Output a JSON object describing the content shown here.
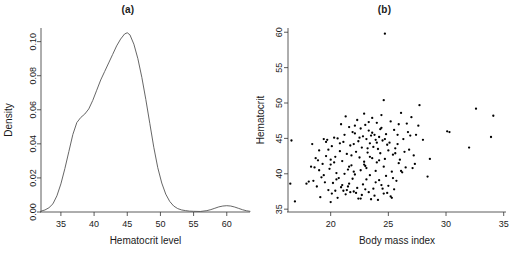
{
  "figure": {
    "panels": [
      {
        "id": "a",
        "title": "(a)"
      },
      {
        "id": "b",
        "title": "(b)"
      }
    ]
  },
  "chart_data": [
    {
      "type": "line",
      "panel": "(a)",
      "title": "(a)",
      "xlabel": "Hematocrit level",
      "ylabel": "Density",
      "xlim": [
        32.0,
        63.5
      ],
      "ylim": [
        0.0,
        0.108
      ],
      "xticks": [
        35,
        40,
        45,
        50,
        55,
        60
      ],
      "yticks": [
        0.0,
        0.02,
        0.04,
        0.06,
        0.08,
        0.1
      ],
      "ytick_labels": [
        "0.00",
        "0.02",
        "0.04",
        "0.06",
        "0.08",
        "0.10"
      ],
      "xtick_labels": [
        "35",
        "40",
        "45",
        "50",
        "55",
        "60"
      ],
      "grid": false,
      "legend": "none",
      "series": [
        {
          "name": "Hematocrit level kernel density",
          "x": [
            32.0,
            32.6,
            33.2,
            33.8,
            34.4,
            35.0,
            35.6,
            36.2,
            36.8,
            37.4,
            38.0,
            38.6,
            39.2,
            39.8,
            40.4,
            41.0,
            41.6,
            42.2,
            42.8,
            43.4,
            44.0,
            44.6,
            45.0,
            45.4,
            46.0,
            46.6,
            47.2,
            47.8,
            48.4,
            49.0,
            49.6,
            50.2,
            50.8,
            51.4,
            52.0,
            52.6,
            53.2,
            53.8,
            54.4,
            55.0,
            56.0,
            57.0,
            57.6,
            58.2,
            58.8,
            59.4,
            60.0,
            60.6,
            61.2,
            61.8,
            62.4,
            63.0,
            63.5
          ],
          "y": [
            0.0005,
            0.0012,
            0.0025,
            0.0048,
            0.0095,
            0.0165,
            0.0255,
            0.0355,
            0.0455,
            0.0525,
            0.0555,
            0.0575,
            0.0605,
            0.0655,
            0.0715,
            0.0775,
            0.0825,
            0.0875,
            0.0925,
            0.0975,
            0.1015,
            0.1045,
            0.1052,
            0.104,
            0.0985,
            0.09,
            0.079,
            0.066,
            0.052,
            0.038,
            0.026,
            0.017,
            0.0105,
            0.0062,
            0.0035,
            0.002,
            0.0012,
            0.0008,
            0.0005,
            0.0004,
            0.0003,
            0.0008,
            0.0014,
            0.0022,
            0.003,
            0.0035,
            0.0037,
            0.0035,
            0.0029,
            0.0021,
            0.0013,
            0.0007,
            0.0004
          ]
        }
      ]
    },
    {
      "type": "scatter",
      "panel": "(b)",
      "title": "(b)",
      "xlabel": "Body mass index",
      "ylabel": "Hematocrit",
      "xlim": [
        16.3,
        35.2
      ],
      "ylim": [
        34.6,
        60.6
      ],
      "xticks": [
        20,
        25,
        30,
        35
      ],
      "yticks": [
        35,
        40,
        45,
        50,
        55,
        60
      ],
      "xtick_labels": [
        "20",
        "25",
        "30",
        "35"
      ],
      "ytick_labels": [
        "35",
        "40",
        "45",
        "50",
        "55",
        "60"
      ],
      "grid": false,
      "legend": "none",
      "marker": "filled-circle",
      "points": [
        [
          24.7,
          59.8
        ],
        [
          24.6,
          50.4
        ],
        [
          27.7,
          49.7
        ],
        [
          32.6,
          49.2
        ],
        [
          22.9,
          48.5
        ],
        [
          34.1,
          48.2
        ],
        [
          21.3,
          48.1
        ],
        [
          26.1,
          48.6
        ],
        [
          27.0,
          48.0
        ],
        [
          23.6,
          47.9
        ],
        [
          22.3,
          47.6
        ],
        [
          25.2,
          47.4
        ],
        [
          20.9,
          47.0
        ],
        [
          24.0,
          47.2
        ],
        [
          26.6,
          47.1
        ],
        [
          23.0,
          46.9
        ],
        [
          21.6,
          46.6
        ],
        [
          24.4,
          46.5
        ],
        [
          22.6,
          46.4
        ],
        [
          30.1,
          46.0
        ],
        [
          30.3,
          45.9
        ],
        [
          25.5,
          46.2
        ],
        [
          23.3,
          46.1
        ],
        [
          21.9,
          45.9
        ],
        [
          22.1,
          45.7
        ],
        [
          24.8,
          45.6
        ],
        [
          23.8,
          45.5
        ],
        [
          23.5,
          45.4
        ],
        [
          22.8,
          45.3
        ],
        [
          24.2,
          45.2
        ],
        [
          25.8,
          45.5
        ],
        [
          26.9,
          45.4
        ],
        [
          20.3,
          45.1
        ],
        [
          20.6,
          45.0
        ],
        [
          19.4,
          44.9
        ],
        [
          19.7,
          44.8
        ],
        [
          23.1,
          44.9
        ],
        [
          23.9,
          44.8
        ],
        [
          24.5,
          44.7
        ],
        [
          22.4,
          44.6
        ],
        [
          21.1,
          44.5
        ],
        [
          16.6,
          44.7
        ],
        [
          18.4,
          44.2
        ],
        [
          33.9,
          45.2
        ],
        [
          27.4,
          45.5
        ],
        [
          26.3,
          44.9
        ],
        [
          25.1,
          44.4
        ],
        [
          23.4,
          44.3
        ],
        [
          22.0,
          44.2
        ],
        [
          24.9,
          44.1
        ],
        [
          21.7,
          44.0
        ],
        [
          20.1,
          43.9
        ],
        [
          23.7,
          43.8
        ],
        [
          22.7,
          43.7
        ],
        [
          25.6,
          43.6
        ],
        [
          24.1,
          43.5
        ],
        [
          26.8,
          43.4
        ],
        [
          32.0,
          43.7
        ],
        [
          19.0,
          43.3
        ],
        [
          20.8,
          43.2
        ],
        [
          22.2,
          43.1
        ],
        [
          23.2,
          43.0
        ],
        [
          24.3,
          42.9
        ],
        [
          21.4,
          42.8
        ],
        [
          25.4,
          42.7
        ],
        [
          27.2,
          42.6
        ],
        [
          19.6,
          42.5
        ],
        [
          20.4,
          42.4
        ],
        [
          22.5,
          42.3
        ],
        [
          23.6,
          42.2
        ],
        [
          24.7,
          42.1
        ],
        [
          26.0,
          42.0
        ],
        [
          28.6,
          42.1
        ],
        [
          18.9,
          41.9
        ],
        [
          21.0,
          41.8
        ],
        [
          22.9,
          41.7
        ],
        [
          24.0,
          41.6
        ],
        [
          25.9,
          41.5
        ],
        [
          19.3,
          41.4
        ],
        [
          20.0,
          41.3
        ],
        [
          21.8,
          41.2
        ],
        [
          23.0,
          41.1
        ],
        [
          24.6,
          41.0
        ],
        [
          26.5,
          40.9
        ],
        [
          27.1,
          40.8
        ],
        [
          18.3,
          41.0
        ],
        [
          18.6,
          40.9
        ],
        [
          19.9,
          40.7
        ],
        [
          21.5,
          40.6
        ],
        [
          22.6,
          40.5
        ],
        [
          23.9,
          40.4
        ],
        [
          25.3,
          40.3
        ],
        [
          26.2,
          40.2
        ],
        [
          20.5,
          40.1
        ],
        [
          21.2,
          40.0
        ],
        [
          22.1,
          39.9
        ],
        [
          23.4,
          39.8
        ],
        [
          24.8,
          39.7
        ],
        [
          28.4,
          39.6
        ],
        [
          19.2,
          39.5
        ],
        [
          20.7,
          39.4
        ],
        [
          21.9,
          39.3
        ],
        [
          23.1,
          39.2
        ],
        [
          24.2,
          39.1
        ],
        [
          25.7,
          39.0
        ],
        [
          18.1,
          38.9
        ],
        [
          16.5,
          38.6
        ],
        [
          19.5,
          38.8
        ],
        [
          20.2,
          38.7
        ],
        [
          21.6,
          38.6
        ],
        [
          22.8,
          38.5
        ],
        [
          24.4,
          38.4
        ],
        [
          25.0,
          38.3
        ],
        [
          18.8,
          38.2
        ],
        [
          20.9,
          38.1
        ],
        [
          22.3,
          38.0
        ],
        [
          23.7,
          37.9
        ],
        [
          25.5,
          37.8
        ],
        [
          19.8,
          37.7
        ],
        [
          21.1,
          37.6
        ],
        [
          22.0,
          37.5
        ],
        [
          23.3,
          37.4
        ],
        [
          24.9,
          37.3
        ],
        [
          20.1,
          37.2
        ],
        [
          21.3,
          37.1
        ],
        [
          22.7,
          37.0
        ],
        [
          23.8,
          36.9
        ],
        [
          25.2,
          36.8
        ],
        [
          19.1,
          36.7
        ],
        [
          20.6,
          36.6
        ],
        [
          22.4,
          36.5
        ],
        [
          23.5,
          36.4
        ],
        [
          24.1,
          36.3
        ],
        [
          16.9,
          36.1
        ],
        [
          20.0,
          36.0
        ],
        [
          21.7,
          37.4
        ],
        [
          22.2,
          37.3
        ],
        [
          21.4,
          37.7
        ],
        [
          20.4,
          37.6
        ],
        [
          23.0,
          37.8
        ],
        [
          24.5,
          37.9
        ],
        [
          22.6,
          36.5
        ],
        [
          21.0,
          38.4
        ],
        [
          19.4,
          39.8
        ],
        [
          20.3,
          41.6
        ],
        [
          21.8,
          42.6
        ],
        [
          23.2,
          43.6
        ],
        [
          24.0,
          44.4
        ],
        [
          22.5,
          45.1
        ],
        [
          23.6,
          45.8
        ],
        [
          24.3,
          46.3
        ],
        [
          25.8,
          44.2
        ],
        [
          26.4,
          43.1
        ],
        [
          27.6,
          46.8
        ],
        [
          26.7,
          45.9
        ],
        [
          25.9,
          47.0
        ],
        [
          24.4,
          48.3
        ],
        [
          23.3,
          47.3
        ],
        [
          22.1,
          46.8
        ],
        [
          21.2,
          45.5
        ],
        [
          20.8,
          44.3
        ],
        [
          19.8,
          43.4
        ],
        [
          18.7,
          42.2
        ],
        [
          19.0,
          40.5
        ],
        [
          20.5,
          39.2
        ],
        [
          21.5,
          38.2
        ],
        [
          23.9,
          38.8
        ],
        [
          25.4,
          39.4
        ],
        [
          26.1,
          40.4
        ],
        [
          27.3,
          41.4
        ],
        [
          28.0,
          44.8
        ],
        [
          25.0,
          43.3
        ],
        [
          24.7,
          44.9
        ],
        [
          23.4,
          42.4
        ],
        [
          22.9,
          41.3
        ],
        [
          22.0,
          40.3
        ],
        [
          23.1,
          40.8
        ],
        [
          24.2,
          41.9
        ],
        [
          25.6,
          42.9
        ],
        [
          21.6,
          41.0
        ],
        [
          20.0,
          42.0
        ],
        [
          19.6,
          44.5
        ],
        [
          18.5,
          39.0
        ],
        [
          17.9,
          38.6
        ],
        [
          24.6,
          37.2
        ],
        [
          25.3,
          36.6
        ]
      ]
    }
  ]
}
